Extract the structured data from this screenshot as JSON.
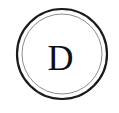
{
  "badge": {
    "type": "circular-monogram-badge",
    "initial": "D",
    "shape": "double-ring-circle",
    "colors": {
      "background": "#ffffff",
      "outer_ring_stroke": "#1a1a1a",
      "inner_ring_stroke": "#8c8c8c",
      "fill": "#ffffff",
      "letter": "#111111"
    },
    "geometry": {
      "canvas_width": 119,
      "canvas_height": 113,
      "center_x": 62,
      "center_y": 54,
      "outer_radius": 45,
      "outer_stroke_width": 2.2,
      "inner_radius": 40,
      "inner_stroke_width": 1
    }
  }
}
